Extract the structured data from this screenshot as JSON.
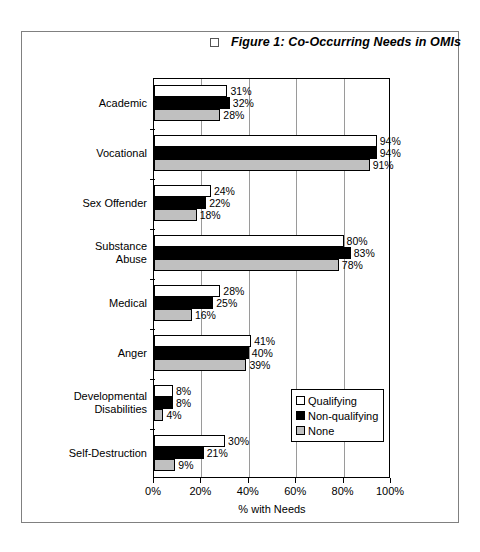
{
  "document": {
    "frame_visible": true
  },
  "title": {
    "checkbox_icon": "empty-checkbox-icon",
    "text": "Figure 1: Co-Occurring Needs in OMIs"
  },
  "chart_data": {
    "type": "bar",
    "orientation": "horizontal",
    "title": "Figure 1: Co-Occurring Needs in OMIs",
    "xlabel": "% with Needs",
    "ylabel": "",
    "xlim": [
      0,
      100
    ],
    "xticks": [
      "0%",
      "20%",
      "40%",
      "60%",
      "80%",
      "100%"
    ],
    "xtick_values": [
      0,
      20,
      40,
      60,
      80,
      100
    ],
    "grid": "vertical",
    "legend_position": "bottom-right-inside",
    "categories": [
      "Academic",
      "Vocational",
      "Sex Offender",
      "Substance Abuse",
      "Medical",
      "Anger",
      "Developmental Disabilities",
      "Self-Destruction"
    ],
    "series": [
      {
        "name": "Qualifying",
        "color": "#ffffff",
        "values": [
          31,
          94,
          24,
          80,
          28,
          41,
          8,
          30
        ],
        "labels": [
          "31%",
          "94%",
          "24%",
          "80%",
          "28%",
          "41%",
          "8%",
          "30%"
        ]
      },
      {
        "name": "Non-qualifying",
        "color": "#000000",
        "values": [
          32,
          94,
          22,
          83,
          25,
          40,
          8,
          21
        ],
        "labels": [
          "32%",
          "94%",
          "22%",
          "83%",
          "25%",
          "40%",
          "8%",
          "21%"
        ]
      },
      {
        "name": "None",
        "color": "#c0c0c0",
        "values": [
          28,
          91,
          18,
          78,
          16,
          39,
          4,
          9
        ],
        "labels": [
          "28%",
          "91%",
          "18%",
          "78%",
          "16%",
          "39%",
          "4%",
          "9%"
        ]
      }
    ]
  },
  "legend": {
    "items": [
      {
        "label": "Qualifying",
        "color": "#ffffff"
      },
      {
        "label": "Non-qualifying",
        "color": "#000000"
      },
      {
        "label": "None",
        "color": "#c0c0c0"
      }
    ]
  }
}
